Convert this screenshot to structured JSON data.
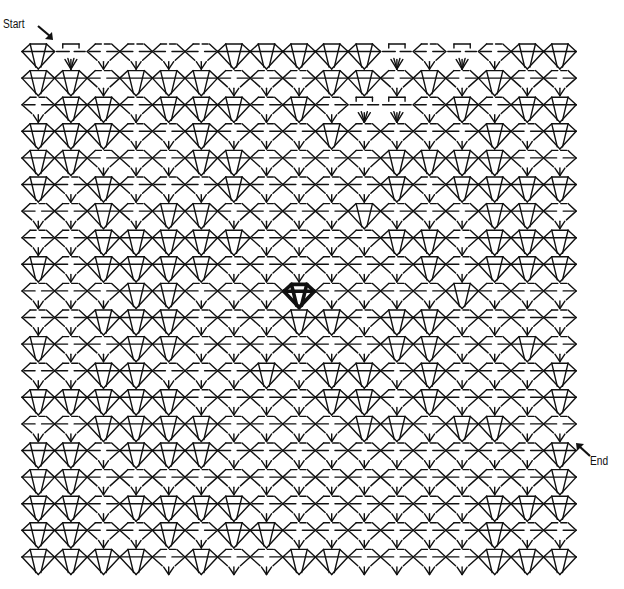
{
  "puzzle": {
    "type": "maze",
    "theme": "diamond",
    "start_label": "Start",
    "end_label": "End",
    "colors": {
      "line": "#111111",
      "background": "#ffffff",
      "goal": "#000000"
    },
    "grid": {
      "columns": 17,
      "rows": 20,
      "origin_x": 22,
      "origin_y": 43,
      "cell_w": 32.6,
      "cell_h": 26.6
    },
    "goal_diamond": {
      "row": 9,
      "col": 8
    },
    "start_cell": {
      "row": 0,
      "col": 0
    },
    "end_cell": {
      "row": 15,
      "col": 16
    },
    "legend": {
      "F": "full diamond (wall)",
      "P": "broken diamond (open passage)",
      "T": "open top with fan (passage)"
    },
    "cells": [
      "FTPPPPFFFFFTPTPFF",
      "FFPFFFPPPFFPFPFPP",
      "PFFPFFFPFPTTPFPFF",
      "FFFPPFPPPFPPPPFPF",
      "FFPPPFFPPPPFFFFPP",
      "FPFPPPFPPPPFPFFFF",
      "PPFPFFPPPPFPPPFFP",
      "PPFFFFFPPPPFFPFFF",
      "FPFFFFPPPPPPFPFFF",
      "PPPFFPPPFPPPPFPPP",
      "PPFFFPPPFFPFFPPPP",
      "FPPFFPPPPPPFFPPFP",
      "PPFFPPPFPFFPFPPPF",
      "FFFFFPPPPFFPFPPPF",
      "PPFFFFPPPPFFPFFPP",
      "FFPFFFPPPPPPPPPPF",
      "FFPPPPPPPPPPPPPPF",
      "FFPFFFFPPPPPPPFFF",
      "FFPPFPFFPPPPPPFPP",
      "FFFFPFPPFFPPPPFFF"
    ]
  }
}
